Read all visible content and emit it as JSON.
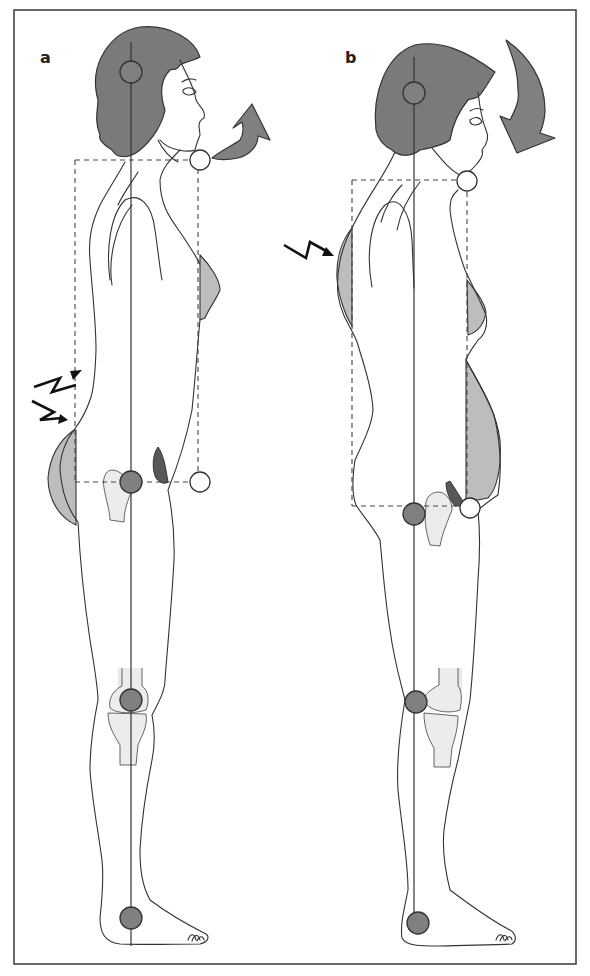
{
  "figure": {
    "panels": [
      {
        "label": "a",
        "plumb_line_landmarks": [
          "ear",
          "hip",
          "knee",
          "ankle"
        ],
        "open_markers": [
          "chin",
          "pubic symphysis"
        ],
        "head_rotation_arrow": "upward-forward",
        "pain_indicators": 2,
        "pain_locations": [
          "lower back (lumbar)",
          "lower back (lumbar)"
        ],
        "shaded_regions": [
          "buttock",
          "chest"
        ]
      },
      {
        "label": "b",
        "plumb_line_landmarks": [
          "ear",
          "hip",
          "knee",
          "ankle"
        ],
        "open_markers": [
          "chin",
          "pubic symphysis"
        ],
        "head_rotation_arrow": "downward-forward",
        "pain_indicators": 1,
        "pain_locations": [
          "upper back (thoracic)"
        ],
        "shaded_regions": [
          "upper back",
          "chest",
          "abdomen"
        ]
      }
    ],
    "colors": {
      "joint_fill": "#808080",
      "hair_fill": "#7a7a7a",
      "shade_fill": "#bdbdbd",
      "bone_fill": "#ececec",
      "wedge_fill": "#585858",
      "line": "#333333",
      "background": "#ffffff"
    }
  }
}
